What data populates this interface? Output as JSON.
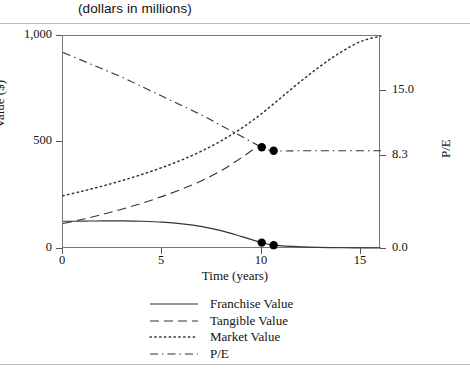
{
  "header": {
    "title": "(dollars in millions)"
  },
  "chart_data": {
    "type": "line",
    "title": "(dollars in millions)",
    "xlabel": "Time (years)",
    "ylabel": "Value ($)",
    "y2label": "P/E",
    "xlim": [
      0,
      16
    ],
    "ylim": [
      0,
      1000
    ],
    "y2lim": [
      0,
      18.0
    ],
    "grid": false,
    "legend_position": "bottom-center",
    "xticks": [
      0,
      5,
      10,
      15
    ],
    "xticklabels": [
      "0",
      "5",
      "10",
      "15"
    ],
    "yticks": [
      0,
      500,
      1000
    ],
    "yticklabels": [
      "0",
      "500",
      "1,000"
    ],
    "y2ticks": [
      0.0,
      8.3,
      15.0
    ],
    "y2ticklabels": [
      "0.0",
      "8.3",
      "15.0"
    ],
    "series": [
      {
        "name": "Franchise Value",
        "style": "solid",
        "axis": "left",
        "x": [
          0,
          1,
          2,
          3,
          4,
          5,
          6,
          7,
          8,
          9,
          10,
          10.6,
          12,
          14,
          16
        ],
        "values": [
          130,
          131,
          132,
          132,
          130,
          126,
          118,
          105,
          85,
          58,
          30,
          18,
          10,
          6,
          5
        ]
      },
      {
        "name": "Tangible Value",
        "style": "dashed",
        "axis": "left",
        "x": [
          0,
          1,
          2,
          3,
          4,
          5,
          6,
          7,
          8,
          9,
          9.6
        ],
        "values": [
          120,
          140,
          163,
          188,
          216,
          247,
          282,
          322,
          370,
          430,
          470
        ]
      },
      {
        "name": "Market Value",
        "style": "dotted",
        "axis": "left",
        "x": [
          0,
          1,
          2,
          3,
          4,
          5,
          6,
          7,
          8,
          9,
          10,
          11,
          12,
          13,
          14,
          15,
          16
        ],
        "values": [
          250,
          272,
          296,
          322,
          351,
          383,
          419,
          461,
          510,
          568,
          636,
          713,
          790,
          862,
          925,
          975,
          1000
        ]
      },
      {
        "name": "P/E",
        "style": "dashdot",
        "axis": "right",
        "x": [
          0,
          1,
          2,
          3,
          4,
          5,
          6,
          7,
          8,
          9,
          10,
          10.6,
          12,
          14,
          16
        ],
        "values": [
          16.6,
          15.9,
          15.2,
          14.5,
          13.7,
          12.9,
          12.1,
          11.3,
          10.4,
          9.5,
          8.6,
          8.3,
          8.3,
          8.3,
          8.3
        ]
      }
    ],
    "markers": [
      {
        "label": "pe-marker-1",
        "series": "P/E",
        "x": 10.0,
        "y": 8.6,
        "axis": "right"
      },
      {
        "label": "pe-marker-2",
        "series": "P/E",
        "x": 10.6,
        "y": 8.3,
        "axis": "right"
      },
      {
        "label": "franchise-marker-1",
        "series": "Franchise Value",
        "x": 10.0,
        "y": 30,
        "axis": "left"
      },
      {
        "label": "franchise-marker-2",
        "series": "Franchise Value",
        "x": 10.6,
        "y": 18,
        "axis": "left"
      }
    ],
    "legend": [
      {
        "label": "Franchise Value",
        "style": "solid"
      },
      {
        "label": "Tangible Value",
        "style": "dashed"
      },
      {
        "label": "Market Value",
        "style": "dotted"
      },
      {
        "label": "P/E",
        "style": "dashdot"
      }
    ],
    "colors": {
      "line": "#333333",
      "marker": "#000000",
      "frame": "#777777",
      "rule": "#b9b9b9"
    }
  }
}
